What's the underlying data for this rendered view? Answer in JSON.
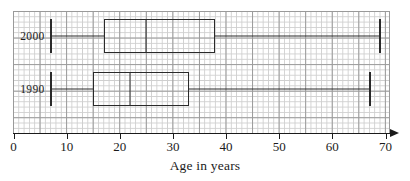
{
  "chart_data": {
    "type": "box",
    "title": "",
    "xlabel": "Age in years",
    "ylabel": "",
    "xlim": [
      0,
      70
    ],
    "grid": true,
    "grid_style": "graph-paper",
    "legend": "none",
    "orientation": "horizontal",
    "xticks": [
      0,
      10,
      20,
      30,
      40,
      50,
      60,
      70
    ],
    "xtick_labels": [
      "0",
      "10",
      "20",
      "30",
      "40",
      "50",
      "60",
      "70"
    ],
    "categories": [
      "2000",
      "1990"
    ],
    "series": [
      {
        "name": "2000",
        "min": 7,
        "q1": 17,
        "median": 25,
        "q3": 38,
        "max": 69
      },
      {
        "name": "1990",
        "min": 7,
        "q1": 15,
        "median": 22,
        "q3": 33,
        "max": 67
      }
    ],
    "colors": {
      "box_stroke": "#2a2a2a",
      "axis": "#1b1b1b",
      "grid_major": "#9a9a9a",
      "grid_minor": "#cfcfcf",
      "background": "#ffffff"
    }
  },
  "axis": {
    "title": "Age in years",
    "ticks": [
      {
        "value": 0,
        "label": "0"
      },
      {
        "value": 10,
        "label": "10"
      },
      {
        "value": 20,
        "label": "20"
      },
      {
        "value": 30,
        "label": "30"
      },
      {
        "value": 40,
        "label": "40"
      },
      {
        "value": 50,
        "label": "50"
      },
      {
        "value": 60,
        "label": "60"
      },
      {
        "value": 70,
        "label": "70"
      }
    ]
  },
  "rows": [
    {
      "label": "2000",
      "min": 7,
      "q1": 17,
      "median": 25,
      "q3": 38,
      "max": 69
    },
    {
      "label": "1990",
      "min": 7,
      "q1": 15,
      "median": 22,
      "q3": 33,
      "max": 67
    }
  ]
}
